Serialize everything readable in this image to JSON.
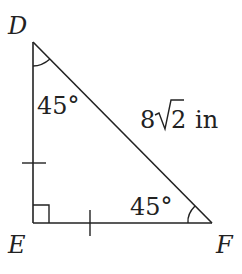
{
  "diagram": {
    "type": "right isosceles triangle",
    "vertices": {
      "D": {
        "label": "D"
      },
      "E": {
        "label": "E"
      },
      "F": {
        "label": "F"
      }
    },
    "angles": {
      "D": "45°",
      "F": "45°",
      "E": "right angle"
    },
    "hypotenuse_label": "8√2 in",
    "hypotenuse_parts": {
      "coef": "8",
      "radicand": "2",
      "unit": "in"
    },
    "congruent_sides": [
      "DE",
      "EF"
    ],
    "stroke_color": "#222222"
  }
}
